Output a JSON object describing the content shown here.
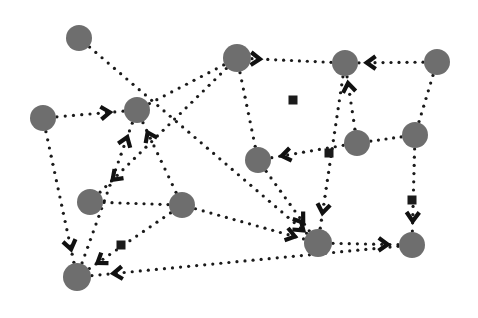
{
  "canvas": {
    "width": 478,
    "height": 318,
    "background": "#ffffff",
    "title": "directed-graph-diagram"
  },
  "style": {
    "node_fill": "#6e6e6e",
    "edge_color": "#1a1a1a",
    "arrow_color": "#111111",
    "square_color": "#1a1a1a",
    "node_radius": 13,
    "edge_dot_diameter": 3.2,
    "edge_dot_gap": 8.2,
    "arrow_size": 11,
    "square_size": 9
  },
  "chart_data": {
    "type": "scatter",
    "title": "",
    "xlabel": "",
    "ylabel": "",
    "xlim": [
      0,
      478
    ],
    "ylim": [
      0,
      318
    ],
    "grid": false,
    "legend": "none",
    "nodes": [
      {
        "id": "n0",
        "label": "",
        "x": 79,
        "y": 38,
        "r": 13
      },
      {
        "id": "n1",
        "label": "",
        "x": 43,
        "y": 118,
        "r": 13
      },
      {
        "id": "n2",
        "label": "",
        "x": 137,
        "y": 110,
        "r": 13
      },
      {
        "id": "n3",
        "label": "",
        "x": 237,
        "y": 58,
        "r": 14
      },
      {
        "id": "n4",
        "label": "",
        "x": 345,
        "y": 63,
        "r": 13
      },
      {
        "id": "n5",
        "label": "",
        "x": 437,
        "y": 62,
        "r": 13
      },
      {
        "id": "n6",
        "label": "",
        "x": 415,
        "y": 135,
        "r": 13
      },
      {
        "id": "n7",
        "label": "",
        "x": 357,
        "y": 143,
        "r": 13
      },
      {
        "id": "n8",
        "label": "",
        "x": 258,
        "y": 160,
        "r": 13
      },
      {
        "id": "n9",
        "label": "",
        "x": 90,
        "y": 202,
        "r": 13
      },
      {
        "id": "n10",
        "label": "",
        "x": 182,
        "y": 205,
        "r": 13
      },
      {
        "id": "n11",
        "label": "",
        "x": 318,
        "y": 243,
        "r": 14
      },
      {
        "id": "n12",
        "label": "",
        "x": 412,
        "y": 245,
        "r": 13
      },
      {
        "id": "n13",
        "label": "",
        "x": 77,
        "y": 277,
        "r": 14
      }
    ],
    "edges": [
      {
        "from": "n0",
        "to": "n11",
        "arrow": true,
        "arrow_at": 0.985
      },
      {
        "from": "n1",
        "to": "n2",
        "arrow": true,
        "arrow_at": 0.8
      },
      {
        "from": "n1",
        "to": "n13",
        "arrow": true,
        "arrow_at": 0.9
      },
      {
        "from": "n2",
        "to": "n3",
        "arrow": false
      },
      {
        "from": "n10",
        "to": "n2",
        "arrow": true,
        "arrow_at": 0.86
      },
      {
        "from": "n13",
        "to": "n2",
        "arrow": true,
        "arrow_at": 0.9
      },
      {
        "from": "n3",
        "to": "n4",
        "arrow": true,
        "arrow_at": 0.1
      },
      {
        "from": "n3",
        "to": "n8",
        "arrow": false
      },
      {
        "from": "n3",
        "to": "n9",
        "arrow": true,
        "arrow_at": 0.9
      },
      {
        "from": "n5",
        "to": "n4",
        "arrow": true,
        "arrow_at": 0.88
      },
      {
        "from": "n5",
        "to": "n6",
        "arrow": false
      },
      {
        "from": "n4",
        "to": "n11",
        "arrow": true,
        "arrow_at": 0.9
      },
      {
        "from": "n7",
        "to": "n4",
        "arrow": true,
        "arrow_at": 0.88
      },
      {
        "from": "n6",
        "to": "n7",
        "arrow": false
      },
      {
        "from": "n7",
        "to": "n8",
        "arrow": true,
        "arrow_at": 0.86
      },
      {
        "from": "n8",
        "to": "n11",
        "arrow": true,
        "arrow_at": 0.86
      },
      {
        "from": "n6",
        "to": "n12",
        "arrow": true,
        "arrow_at": 0.88
      },
      {
        "from": "n11",
        "to": "n12",
        "arrow": true,
        "arrow_at": 0.84
      },
      {
        "from": "n10",
        "to": "n11",
        "arrow": true,
        "arrow_at": 0.92
      },
      {
        "from": "n9",
        "to": "n10",
        "arrow": false
      },
      {
        "from": "n10",
        "to": "n13",
        "arrow": true,
        "arrow_at": 0.9
      },
      {
        "from": "n12",
        "to": "n13",
        "arrow": true,
        "arrow_at": 0.93
      }
    ],
    "square_markers": [
      {
        "x": 293,
        "y": 100,
        "on_edge": "n3-n9"
      },
      {
        "x": 329,
        "y": 153,
        "on_edge": "n7-n8"
      },
      {
        "x": 412,
        "y": 200,
        "on_edge": "n6-n12"
      },
      {
        "x": 121,
        "y": 245,
        "on_edge": "n10-n13"
      }
    ]
  }
}
